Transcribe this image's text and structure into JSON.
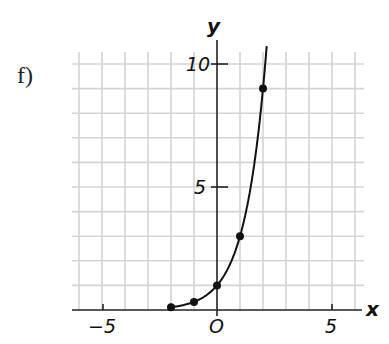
{
  "problem_label": "f)",
  "chart_data": {
    "type": "line",
    "title": "",
    "xlabel": "x",
    "ylabel": "y",
    "function": "y = 3^x",
    "x_ticks": [
      -5,
      5
    ],
    "y_ticks": [
      5,
      10
    ],
    "origin_label": "O",
    "xlim": [
      -6,
      6
    ],
    "ylim": [
      0,
      10.5
    ],
    "grid": true,
    "series": [
      {
        "name": "curve",
        "points": [
          {
            "x": -2,
            "y": 0.11
          },
          {
            "x": -1,
            "y": 0.33
          },
          {
            "x": 0,
            "y": 1
          },
          {
            "x": 1,
            "y": 3
          },
          {
            "x": 2,
            "y": 9
          }
        ]
      }
    ]
  },
  "labels": {
    "x_axis": "x",
    "y_axis": "y",
    "x_tick_neg": "−5",
    "x_tick_pos": "5",
    "y_tick_5": "5",
    "y_tick_10": "10",
    "origin": "O"
  }
}
